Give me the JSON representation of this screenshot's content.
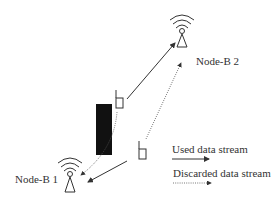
{
  "nodes": {
    "node_b1": {
      "label": "Node-B 1"
    },
    "node_b2": {
      "label": "Node-B 2"
    }
  },
  "legend": {
    "used": {
      "label": "Used data stream"
    },
    "discarded": {
      "label": "Discarded data stream"
    }
  },
  "colors": {
    "stroke": "#333333",
    "obstacle": "#111111"
  }
}
